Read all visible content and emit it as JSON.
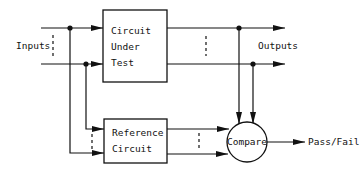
{
  "diagram": {
    "labels": {
      "inputs": "Inputs",
      "outputs": "Outputs",
      "pass_fail": "Pass/Fail"
    },
    "blocks": {
      "cut": {
        "line1": "Circuit",
        "line2": "Under",
        "line3": "Test"
      },
      "reference": {
        "line1": "Reference",
        "line2": "Circuit"
      },
      "compare": {
        "label": "Compare"
      }
    },
    "colors": {
      "stroke": "#111111",
      "background": "#ffffff"
    }
  }
}
